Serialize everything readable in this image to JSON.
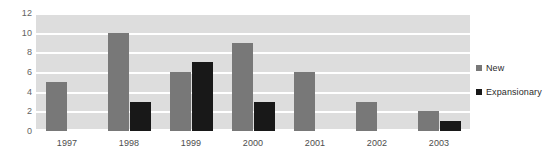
{
  "chart_data": {
    "type": "bar",
    "title": "",
    "xlabel": "",
    "ylabel": "",
    "categories": [
      "1997",
      "1998",
      "1999",
      "2000",
      "2001",
      "2002",
      "2003"
    ],
    "series": [
      {
        "name": "New",
        "color": "#787878",
        "values": [
          5,
          10,
          6,
          9,
          6,
          3,
          2
        ]
      },
      {
        "name": "Expansionary",
        "color": "#181818",
        "values": [
          0,
          3,
          7,
          3,
          0,
          0,
          1
        ]
      }
    ],
    "ylim": [
      0,
      12
    ],
    "ytick_labels": [
      "12",
      "10",
      "8",
      "6",
      "4",
      "2",
      "0"
    ],
    "ytick_values": [
      12,
      10,
      8,
      6,
      4,
      2,
      0
    ],
    "grid": true,
    "grid_color": "#ffffff",
    "plot_background": "#dddddd",
    "legend_position": "right"
  },
  "legend": {
    "entries": [
      {
        "label": "New",
        "swatch": "legend-swatch-new"
      },
      {
        "label": "Expansionary",
        "swatch": "legend-swatch-expansionary"
      }
    ]
  }
}
